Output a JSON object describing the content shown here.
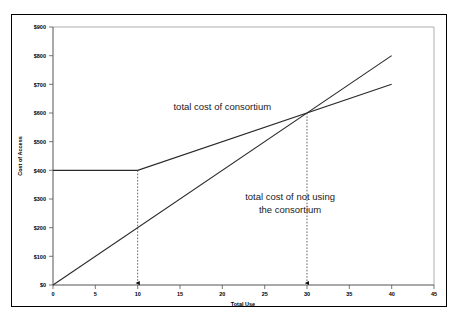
{
  "chart_data": {
    "type": "line",
    "title": "",
    "xlabel": "Total Use",
    "ylabel": "Cost of Access",
    "xlim": [
      0,
      45
    ],
    "ylim": [
      0,
      900
    ],
    "grid": false,
    "legend_position": "inline-annotations",
    "xticks": [
      "0",
      "5",
      "10",
      "15",
      "20",
      "25",
      "30",
      "35",
      "40",
      "45"
    ],
    "xtick_values": [
      0,
      5,
      10,
      15,
      20,
      25,
      30,
      35,
      40,
      45
    ],
    "yticks": [
      "$0",
      "$100",
      "$200",
      "$300",
      "$400",
      "$500",
      "$600",
      "$700",
      "$800",
      "$900"
    ],
    "ytick_values": [
      0,
      100,
      200,
      300,
      400,
      500,
      600,
      700,
      800,
      900
    ],
    "series": [
      {
        "name": "total cost of consortium",
        "points": [
          [
            0,
            400
          ],
          [
            10,
            400
          ],
          [
            40,
            700
          ]
        ]
      },
      {
        "name": "total cost of not using the consortium",
        "points": [
          [
            0,
            0
          ],
          [
            40,
            800
          ]
        ]
      }
    ],
    "annotations": [
      {
        "name": "consortium-label",
        "text": "total cost of consortium",
        "x": 20,
        "y": 610
      },
      {
        "name": "not-using-label-line1",
        "text": "total cost of not using",
        "x": 28,
        "y": 295
      },
      {
        "name": "not-using-label-line2",
        "text": "the consortium",
        "x": 28,
        "y": 250
      }
    ],
    "arrows": [
      {
        "name": "kink-arrow",
        "x": 10,
        "y_from": 400,
        "y_to": 0
      },
      {
        "name": "intersection-arrow",
        "x": 30,
        "y_from": 600,
        "y_to": 0
      }
    ],
    "intersection": {
      "x": 30,
      "y": 600
    }
  },
  "colors": {
    "line": "#2a2a2a",
    "axis": "#555555",
    "frame": "#000000",
    "background": "#ffffff",
    "annotation": "#555555"
  }
}
